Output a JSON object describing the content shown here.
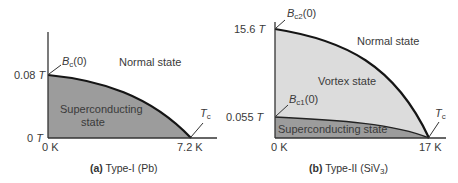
{
  "panels": [
    {
      "caption_prefix": "(a)",
      "caption_text": "Type-I (Pb)",
      "y_labels": {
        "top_value": "0.08",
        "top_unit": "T",
        "zero_value": "0",
        "zero_unit": "T"
      },
      "x_labels": {
        "zero": "0 K",
        "tc": "7.2 K"
      },
      "annotations": {
        "critical_field_main": "B",
        "critical_field_sub": "c",
        "critical_field_arg": "(0)",
        "tc_main": "T",
        "tc_sub": "c"
      },
      "regions": {
        "normal": "Normal state",
        "superconducting_line1": "Superconducting",
        "superconducting_line2": "state"
      },
      "colors": {
        "superconducting_fill": "#9a9a9a",
        "curve": "#1a1a1a"
      }
    },
    {
      "caption_prefix": "(b)",
      "caption_text_main": "Type-II (SiV",
      "caption_text_sub": "3",
      "caption_text_end": ")",
      "y_labels": {
        "upper_value": "15.6",
        "upper_unit": "T",
        "lower_value": "0.055",
        "lower_unit": "T"
      },
      "x_labels": {
        "zero": "0 K",
        "tc": "17 K"
      },
      "annotations": {
        "bc2_main": "B",
        "bc2_sub": "c2",
        "bc2_arg": "(0)",
        "bc1_main": "B",
        "bc1_sub": "c1",
        "bc1_arg": "(0)",
        "tc_main": "T",
        "tc_sub": "c"
      },
      "regions": {
        "normal": "Normal state",
        "vortex": "Vortex state",
        "superconducting": "Superconducting state"
      },
      "colors": {
        "vortex_fill": "#d9d9d9",
        "superconducting_fill": "#9a9a9a",
        "curve": "#1a1a1a"
      }
    }
  ]
}
